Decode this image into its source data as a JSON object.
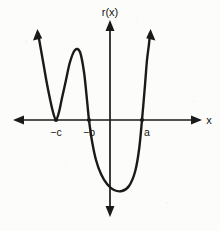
{
  "figure": {
    "kind": "cartesian-plot",
    "width": 220,
    "height": 231,
    "background_color": "#fbfbfa",
    "ink_color": "#1a1a1a"
  },
  "axes": {
    "y_axis_label": "r(x)",
    "x_axis_label": "x",
    "x_axis_y_px": 120,
    "y_axis_x_px": 110,
    "x_axis_start_px": 15,
    "x_axis_end_px": 200,
    "y_axis_top_px": 22,
    "y_axis_bottom_px": 215,
    "arrowheads": "both-ends-both-axes",
    "gridlines": "none"
  },
  "tick_labels": [
    {
      "name": "root-neg-c",
      "text": "−c",
      "x_px": 56,
      "y_px": 136
    },
    {
      "name": "root-neg-b",
      "text": "−b",
      "x_px": 89,
      "y_px": 136
    },
    {
      "name": "root-a",
      "text": "a",
      "x_px": 147,
      "y_px": 136
    }
  ],
  "chart_data": {
    "type": "line",
    "title": "",
    "subtitle": "",
    "xlabel": "x",
    "ylabel": "r(x)",
    "legend": [],
    "legend_position": "none",
    "grid": false,
    "xlim": [
      15,
      200
    ],
    "ylim": [
      215,
      22
    ],
    "annotations": [
      "left branch rises to upper-left with arrowhead",
      "curve touches x-axis tangentially at -c (double root, local minimum on the axis)",
      "local maximum between -c and -b above the axis",
      "curve crosses x-axis at -b going downward",
      "deep global minimum below the axis between -b and a",
      "curve crosses x-axis at a going upward",
      "right branch rises to upper-right with arrowhead"
    ],
    "series": [
      {
        "name": "r(x)",
        "color": "#1a1a1a",
        "points_px": [
          [
            38,
            33
          ],
          [
            41,
            50
          ],
          [
            44,
            67
          ],
          [
            47,
            84
          ],
          [
            50,
            99
          ],
          [
            53,
            112
          ],
          [
            56,
            120
          ],
          [
            59,
            112
          ],
          [
            62,
            98
          ],
          [
            66,
            80
          ],
          [
            70,
            62
          ],
          [
            75,
            50
          ],
          [
            80,
            52
          ],
          [
            84,
            72
          ],
          [
            87,
            100
          ],
          [
            89,
            120
          ],
          [
            92,
            141
          ],
          [
            96,
            160
          ],
          [
            101,
            174
          ],
          [
            107,
            184
          ],
          [
            114,
            190
          ],
          [
            122,
            191
          ],
          [
            129,
            186
          ],
          [
            135,
            172
          ],
          [
            139,
            150
          ],
          [
            142,
            120
          ],
          [
            145,
            85
          ],
          [
            147,
            60
          ],
          [
            149,
            44
          ],
          [
            150,
            33
          ]
        ]
      }
    ],
    "key_features": {
      "roots": [
        {
          "label": "−c",
          "x_px": 56,
          "multiplicity": 2,
          "behavior": "touches axis (tangent)"
        },
        {
          "label": "−b",
          "x_px": 89,
          "multiplicity": 1,
          "behavior": "crosses downward"
        },
        {
          "label": "a",
          "x_px": 142,
          "multiplicity": 1,
          "behavior": "crosses upward"
        }
      ],
      "local_maximum_px": [
        75,
        50
      ],
      "global_minimum_px": [
        122,
        191
      ],
      "end_behavior_left": "up",
      "end_behavior_right": "up",
      "degree_parity": "even"
    }
  }
}
